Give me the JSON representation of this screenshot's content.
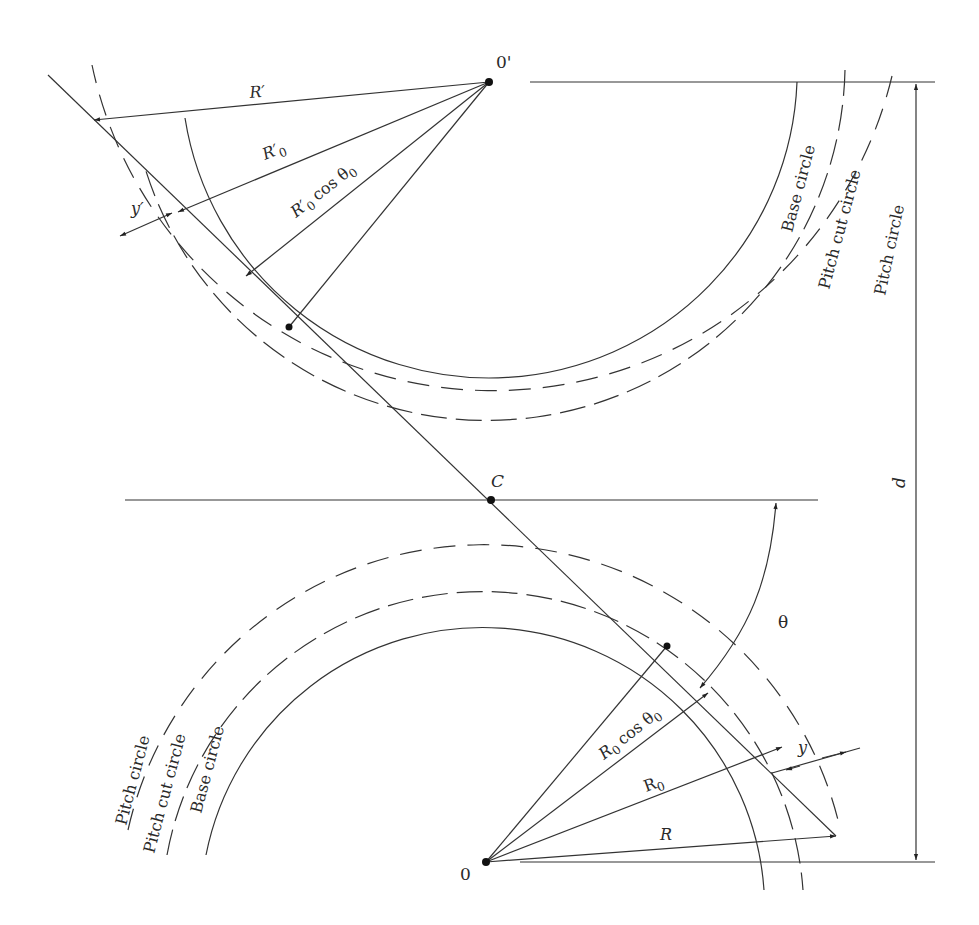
{
  "figure": {
    "type": "gear geometry diagram",
    "points": {
      "upper_center": "0'",
      "lower_center": "0",
      "pitch_point": "C"
    },
    "upper_gear": {
      "radius_labels": {
        "outer": "R′",
        "pitch": "R′",
        "pitch_sub": "0",
        "base": "R′",
        "base_sub": "0",
        "base_cos": "cos θ",
        "base_cos_sub": "0"
      },
      "offset_label": "y′",
      "circle_labels": [
        "Base circle",
        "Pitch cut circle",
        "Pitch circle"
      ]
    },
    "lower_gear": {
      "radius_labels": {
        "outer": "R",
        "pitch": "R",
        "pitch_sub": "0",
        "base": "R",
        "base_sub": "0",
        "base_cos": "cos θ",
        "base_cos_sub": "0"
      },
      "offset_label": "y",
      "circle_labels": [
        "Pitch circle",
        "Pitch cut circle",
        "Base circle"
      ]
    },
    "angle_label": "θ",
    "center_distance_label": "d"
  }
}
